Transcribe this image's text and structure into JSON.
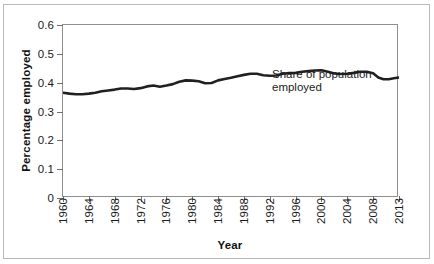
{
  "chart_data": {
    "type": "line",
    "title": "",
    "xlabel": "Year",
    "ylabel": "Percentage employed",
    "xlim": [
      1960,
      2013
    ],
    "ylim": [
      0,
      0.6
    ],
    "grid": false,
    "legend_position": "inline-annotation",
    "annotations": [
      {
        "text_line1": "Share of population",
        "text_line2": "employed",
        "x": 1999,
        "y": 0.345
      }
    ],
    "y_ticks": [
      0,
      0.1,
      0.2,
      0.3,
      0.4,
      0.5,
      0.6
    ],
    "y_tick_labels": [
      "0",
      "0.1",
      "0.2",
      "0.3",
      "0.4",
      "0.5",
      "0.6"
    ],
    "x_ticks": [
      1960,
      1964,
      1968,
      1972,
      1976,
      1980,
      1984,
      1988,
      1992,
      1996,
      2000,
      2004,
      2008,
      2013
    ],
    "x_tick_labels": [
      "1960",
      "1964",
      "1968",
      "1972",
      "1976",
      "1980",
      "1984",
      "1988",
      "1992",
      "1996",
      "2000",
      "2004",
      "2008",
      "2013"
    ],
    "series": [
      {
        "name": "Share of population employed",
        "color": "#231f20",
        "line_width": 2.6,
        "x": [
          1960,
          1961,
          1962,
          1963,
          1964,
          1965,
          1966,
          1967,
          1968,
          1969,
          1970,
          1971,
          1972,
          1973,
          1974,
          1975,
          1976,
          1977,
          1978,
          1979,
          1980,
          1981,
          1982,
          1983,
          1984,
          1985,
          1986,
          1987,
          1988,
          1989,
          1990,
          1991,
          1992,
          1993,
          1994,
          1995,
          1996,
          1997,
          1998,
          1999,
          2000,
          2001,
          2002,
          2003,
          2004,
          2005,
          2006,
          2007,
          2008,
          2009,
          2010,
          2011,
          2012,
          2013
        ],
        "y": [
          0.365,
          0.362,
          0.36,
          0.36,
          0.362,
          0.365,
          0.37,
          0.373,
          0.376,
          0.38,
          0.38,
          0.378,
          0.381,
          0.387,
          0.39,
          0.386,
          0.39,
          0.395,
          0.403,
          0.408,
          0.407,
          0.405,
          0.398,
          0.399,
          0.408,
          0.413,
          0.417,
          0.422,
          0.427,
          0.431,
          0.431,
          0.426,
          0.424,
          0.425,
          0.431,
          0.433,
          0.434,
          0.438,
          0.44,
          0.442,
          0.443,
          0.438,
          0.432,
          0.43,
          0.431,
          0.434,
          0.438,
          0.438,
          0.433,
          0.418,
          0.412,
          0.412,
          0.415,
          0.418
        ]
      }
    ]
  }
}
